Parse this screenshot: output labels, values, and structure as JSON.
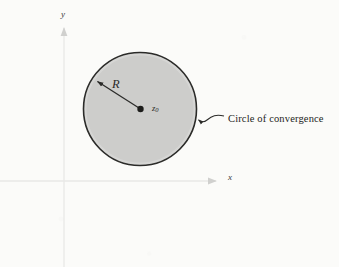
{
  "figure": {
    "background_color": "#fbfbf9",
    "title_visible": false,
    "labels": {
      "radius": "R",
      "center_symbol": "z",
      "center_subscript": "0",
      "axis_x": "x",
      "axis_y": "y",
      "annotation": "Circle of convergence"
    },
    "colors": {
      "disk_fill": "#cdcdcb",
      "circle_stroke": "#2b2b29",
      "axis_stroke": "#e6e6e4",
      "leader_stroke": "#2b2b29",
      "text": "#242422"
    }
  },
  "chart_data": {
    "type": "scatter",
    "title": "",
    "subtitle": "",
    "xlabel": "x",
    "ylabel": "y",
    "grid": false,
    "legend_position": "none",
    "axis_style": "arrow-terminated",
    "xlim": [
      -1.2,
      4.9
    ],
    "ylim": [
      -1.6,
      4.6
    ],
    "origin_px": [
      64,
      181
    ],
    "px_per_unit": 36,
    "shapes": [
      {
        "kind": "circle",
        "name": "circle-of-convergence",
        "center": [
          2.1,
          2.0
        ],
        "center_px": [
          140,
          109
        ],
        "radius": 1.58,
        "radius_px": 57,
        "fill": "#cdcdcb",
        "stroke": "#2b2b29",
        "stroke_width_px": 1.6,
        "label": "Circle of convergence"
      }
    ],
    "points": [
      {
        "name": "center-point",
        "label": "z0",
        "x": 2.1,
        "y": 2.0,
        "x_px": 140,
        "y_px": 109,
        "marker": "filled-dot",
        "marker_size_px": 3.2
      }
    ],
    "annotations": [
      {
        "name": "radius-arrow",
        "text": "R",
        "from_px": [
          140,
          109
        ],
        "to_px": [
          95,
          80
        ],
        "arrowhead": "at-end",
        "label_px": [
          112,
          78
        ],
        "italic": true
      },
      {
        "name": "circle-callout",
        "text": "Circle of convergence",
        "target_px": [
          196,
          120
        ],
        "text_px": [
          228,
          114
        ],
        "leader": "curved"
      }
    ],
    "axes": [
      {
        "name": "x-axis",
        "from_px": [
          0,
          181
        ],
        "to_px": [
          222,
          181
        ],
        "arrowhead": "at-end",
        "label": "x",
        "label_px": [
          228,
          173
        ]
      },
      {
        "name": "y-axis",
        "from_px": [
          64,
          267
        ],
        "to_px": [
          64,
          22
        ],
        "arrowhead": "at-end",
        "label": "y",
        "label_px": [
          61,
          10
        ]
      }
    ]
  }
}
